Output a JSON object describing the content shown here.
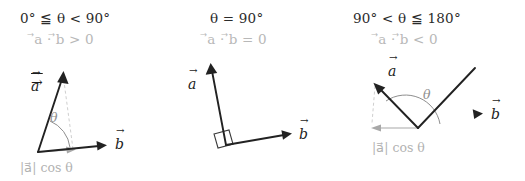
{
  "figure": {
    "background": "#ffffff",
    "vector_color": "#222222",
    "accent_gray": "#8e8e8e",
    "light_gray": "#cfcfcf"
  },
  "panels": [
    {
      "id": "panel-acute",
      "condition": "0° ≦ θ < 90°",
      "dot_product": "⃗a · ⃗b > 0",
      "vector_a_label": "a",
      "vector_b_label": "b",
      "angle_label": "θ",
      "projection_label": "|a⃗| cos θ",
      "has_projection": true,
      "has_right_angle": false
    },
    {
      "id": "panel-right",
      "condition": "θ = 90°",
      "dot_product": "⃗a · ⃗b = 0",
      "vector_a_label": "a",
      "vector_b_label": "b",
      "angle_label": "",
      "projection_label": "",
      "has_projection": false,
      "has_right_angle": true
    },
    {
      "id": "panel-obtuse",
      "condition": "90° < θ ≦ 180°",
      "dot_product": "⃗a · ⃗b < 0",
      "vector_a_label": "a",
      "vector_b_label": "b",
      "angle_label": "θ",
      "projection_label": "|a⃗| cos θ",
      "has_projection": true,
      "has_right_angle": false
    }
  ],
  "glyphs": {
    "dot_operator": "·",
    "theta": "θ",
    "degree": "°",
    "leq_double": "≦"
  }
}
